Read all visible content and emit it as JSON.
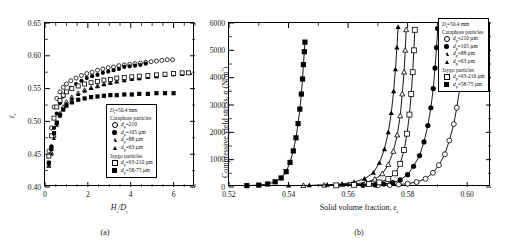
{
  "figure": {
    "panel_a": {
      "caption": "(a)",
      "xlabel": "Hs/Dt",
      "ylabel": "εs",
      "x_ticks": [
        "0",
        "2",
        "4",
        "6"
      ],
      "y_ticks": [
        "0.40",
        "0.45",
        "0.50",
        "0.55",
        "0.60",
        "0.65"
      ]
    },
    "panel_b": {
      "caption": "(b)",
      "xlabel": "Solid volume fraction, εs",
      "ylabel": "Compressive yield stress, σy(N/m2)",
      "x_ticks": [
        "0.52",
        "0.54",
        "0.56",
        "0.58",
        "0.60"
      ],
      "y_ticks": [
        "0",
        "1000",
        "2000",
        "3000",
        "4000",
        "5000",
        "6000"
      ]
    },
    "legend": {
      "title": "Dt=50.4 mm",
      "group1": "Cataphote particles",
      "group2": "Jaygo particles",
      "entries_a": [
        {
          "symbol": "open-circle",
          "label": "dp=210"
        },
        {
          "symbol": "filled-circle",
          "label": "dp=105 µm"
        },
        {
          "symbol": "open-triangle",
          "label": "dp=88 µm"
        },
        {
          "symbol": "filled-triangle",
          "label": "dp=63 µm"
        },
        {
          "symbol": "open-square",
          "label": "dp=93-210 µm"
        },
        {
          "symbol": "filled-square",
          "label": "dp=58-75 µm"
        }
      ],
      "entries_b": [
        {
          "symbol": "open-circle",
          "label": "dp=210 µm"
        },
        {
          "symbol": "filled-circle",
          "label": "dp=105 µm"
        },
        {
          "symbol": "open-triangle",
          "label": "dp=88 µm"
        },
        {
          "symbol": "filled-triangle",
          "label": "dp=63 µm"
        },
        {
          "symbol": "open-square",
          "label": "dp=93-210 µm"
        },
        {
          "symbol": "filled-square",
          "label": "dp=58-75 µm"
        }
      ]
    }
  },
  "chart_data": [
    {
      "type": "scatter",
      "panel": "a",
      "title": "",
      "xlabel": "Hs/Dt",
      "ylabel": "epsilon_s",
      "xlim": [
        0,
        7
      ],
      "ylim": [
        0.4,
        0.65
      ],
      "grid": false,
      "legend_position": "inside-lower-right",
      "series": [
        {
          "name": "Cataphote dp=210",
          "symbol": "open-circle",
          "x": [
            0.18,
            0.3,
            0.42,
            0.55,
            0.7,
            0.85,
            1.0,
            1.2,
            1.45,
            1.7,
            1.95,
            2.2,
            2.45,
            2.7,
            2.95,
            3.2,
            3.45,
            3.7,
            3.95,
            4.2,
            4.45,
            4.7,
            4.95,
            5.2,
            5.45,
            5.7,
            5.95
          ],
          "y": [
            0.455,
            0.49,
            0.522,
            0.535,
            0.545,
            0.552,
            0.557,
            0.562,
            0.566,
            0.57,
            0.573,
            0.575,
            0.578,
            0.58,
            0.582,
            0.583,
            0.585,
            0.586,
            0.587,
            0.588,
            0.589,
            0.59,
            0.591,
            0.592,
            0.593,
            0.594,
            0.594
          ]
        },
        {
          "name": "Cataphote dp=105 µm",
          "symbol": "filled-circle",
          "x": [
            0.18,
            0.3,
            0.42,
            0.55,
            0.7,
            0.85,
            1.0,
            1.2,
            1.45,
            1.7,
            1.95,
            2.2,
            2.45,
            2.7,
            2.95,
            3.2,
            3.45,
            3.7,
            3.95,
            4.2,
            4.45,
            4.7
          ],
          "y": [
            0.437,
            0.462,
            0.49,
            0.512,
            0.528,
            0.538,
            0.545,
            0.551,
            0.557,
            0.562,
            0.566,
            0.569,
            0.571,
            0.574,
            0.576,
            0.578,
            0.58,
            0.583,
            0.584,
            0.585,
            0.586,
            0.588
          ]
        },
        {
          "name": "Cataphote dp=88 µm",
          "symbol": "open-triangle",
          "x": [
            0.18,
            0.3,
            0.42,
            0.55,
            0.7,
            0.85,
            1.0,
            1.25,
            1.55,
            1.85,
            2.15,
            2.45,
            2.75,
            3.05,
            3.35,
            3.7,
            4.05,
            4.4,
            4.8,
            5.2,
            5.6,
            6.0,
            6.4,
            6.75
          ],
          "y": [
            0.432,
            0.452,
            0.478,
            0.498,
            0.512,
            0.522,
            0.53,
            0.537,
            0.543,
            0.548,
            0.551,
            0.554,
            0.557,
            0.559,
            0.561,
            0.563,
            0.565,
            0.566,
            0.568,
            0.569,
            0.571,
            0.572,
            0.573,
            0.574
          ]
        },
        {
          "name": "Cataphote dp=63 µm",
          "symbol": "filled-triangle",
          "x": [
            0.18,
            0.3,
            0.42,
            0.55,
            0.7,
            0.85,
            1.0,
            1.25,
            1.55,
            1.85,
            2.15,
            2.45,
            2.75,
            3.05,
            3.35,
            3.7,
            4.05,
            4.4,
            4.8,
            5.2,
            5.6,
            6.0,
            6.4,
            6.75
          ],
          "y": [
            0.433,
            0.45,
            0.474,
            0.494,
            0.508,
            0.518,
            0.527,
            0.535,
            0.541,
            0.546,
            0.55,
            0.553,
            0.556,
            0.558,
            0.56,
            0.562,
            0.564,
            0.565,
            0.567,
            0.568,
            0.57,
            0.571,
            0.572,
            0.573
          ]
        },
        {
          "name": "Jaygo dp=93-210 µm",
          "symbol": "open-square",
          "x": [
            0.18,
            0.3,
            0.42,
            0.55,
            0.7,
            0.85,
            1.0,
            1.25,
            1.55,
            1.85,
            2.15,
            2.45,
            2.75,
            3.05,
            3.35,
            3.7,
            4.05,
            4.4,
            4.8,
            5.2,
            5.6,
            6.0,
            6.4,
            6.7
          ],
          "y": [
            0.447,
            0.478,
            0.505,
            0.522,
            0.532,
            0.54,
            0.545,
            0.55,
            0.554,
            0.557,
            0.559,
            0.561,
            0.563,
            0.564,
            0.566,
            0.567,
            0.568,
            0.569,
            0.57,
            0.571,
            0.572,
            0.573,
            0.574,
            0.574
          ]
        },
        {
          "name": "Jaygo dp=58-75 µm",
          "symbol": "filled-square",
          "x": [
            0.18,
            0.3,
            0.42,
            0.55,
            0.7,
            0.85,
            1.0,
            1.25,
            1.55,
            1.85,
            2.15,
            2.45,
            2.75,
            3.05,
            3.35,
            3.7,
            4.05,
            4.4,
            4.8,
            5.2,
            5.6,
            6.0
          ],
          "y": [
            0.437,
            0.458,
            0.482,
            0.498,
            0.51,
            0.518,
            0.524,
            0.529,
            0.533,
            0.535,
            0.537,
            0.538,
            0.539,
            0.54,
            0.54,
            0.541,
            0.541,
            0.542,
            0.542,
            0.543,
            0.543,
            0.543
          ]
        }
      ]
    },
    {
      "type": "line",
      "panel": "b",
      "title": "",
      "xlabel": "Solid volume fraction, epsilon_s",
      "ylabel": "Compressive yield stress, sigma_y (N/m2)",
      "xlim": [
        0.52,
        0.608
      ],
      "ylim": [
        0,
        6000
      ],
      "grid": false,
      "legend_position": "inside-upper-left",
      "series": [
        {
          "name": "Cataphote dp=210 µm",
          "symbol": "open-circle",
          "x": [
            0.57,
            0.574,
            0.577,
            0.58,
            0.583,
            0.586,
            0.5885,
            0.5905,
            0.5925,
            0.594,
            0.5955,
            0.5965,
            0.5975,
            0.598,
            0.5985,
            0.599
          ],
          "y": [
            60,
            70,
            90,
            120,
            180,
            300,
            520,
            800,
            1200,
            1700,
            2300,
            2900,
            3600,
            4300,
            5000,
            5700
          ]
        },
        {
          "name": "Cataphote dp=105 µm",
          "symbol": "filled-circle",
          "x": [
            0.565,
            0.569,
            0.572,
            0.575,
            0.5775,
            0.58,
            0.582,
            0.584,
            0.5855,
            0.5868,
            0.5878,
            0.5886,
            0.5892,
            0.5897,
            0.5901
          ],
          "y": [
            60,
            80,
            110,
            160,
            260,
            450,
            760,
            1150,
            1650,
            2250,
            2900,
            3600,
            4350,
            5100,
            5800
          ]
        },
        {
          "name": "Cataphote dp=88 µm",
          "symbol": "open-triangle",
          "x": [
            0.545,
            0.552,
            0.558,
            0.562,
            0.566,
            0.569,
            0.5715,
            0.5735,
            0.5752,
            0.5765,
            0.5775,
            0.5782,
            0.5788,
            0.5792,
            0.5795
          ],
          "y": [
            50,
            60,
            80,
            110,
            170,
            280,
            480,
            820,
            1300,
            1900,
            2600,
            3400,
            4200,
            5000,
            5750
          ]
        },
        {
          "name": "Cataphote dp=63 µm",
          "symbol": "filled-triangle",
          "x": [
            0.54,
            0.547,
            0.553,
            0.558,
            0.562,
            0.5655,
            0.5685,
            0.5705,
            0.5722,
            0.5735,
            0.5745,
            0.5753,
            0.5759,
            0.5764,
            0.5768
          ],
          "y": [
            50,
            60,
            80,
            110,
            180,
            300,
            520,
            880,
            1380,
            2000,
            2700,
            3500,
            4300,
            5100,
            5850
          ]
        },
        {
          "name": "Jaygo dp=93-210 µm",
          "symbol": "open-square",
          "x": [
            0.556,
            0.562,
            0.567,
            0.5705,
            0.5735,
            0.5758,
            0.5775,
            0.5788,
            0.5798,
            0.5806,
            0.5812,
            0.5817,
            0.5821,
            0.5824
          ],
          "y": [
            60,
            80,
            110,
            170,
            290,
            500,
            850,
            1350,
            1950,
            2650,
            3400,
            4200,
            5000,
            5750
          ]
        },
        {
          "name": "Jaygo dp=58-75 µm",
          "symbol": "filled-square",
          "x": [
            0.526,
            0.53,
            0.533,
            0.5355,
            0.5375,
            0.5392,
            0.5405,
            0.5416,
            0.5425,
            0.5432,
            0.5438,
            0.5443,
            0.5447,
            0.545,
            0.5453,
            0.5455
          ],
          "y": [
            50,
            70,
            110,
            190,
            330,
            560,
            900,
            1320,
            1800,
            2320,
            2850,
            3400,
            3950,
            4480,
            4950,
            5300
          ]
        }
      ]
    }
  ]
}
